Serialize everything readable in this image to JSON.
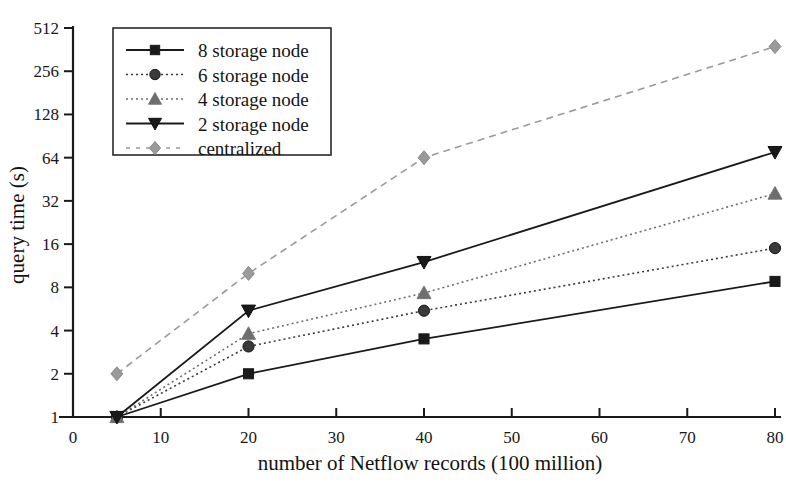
{
  "chart_data": {
    "type": "line",
    "title": "",
    "xlabel": "number of Netflow records (100 million)",
    "ylabel": "query time (s)",
    "xlim": [
      0,
      80
    ],
    "ylim": [
      1,
      512
    ],
    "yscale": "log2",
    "grid": false,
    "legend_position": "top-left",
    "xticks": [
      0,
      10,
      20,
      30,
      40,
      50,
      60,
      70,
      80
    ],
    "xtick_labels": [
      "0",
      "10",
      "20",
      "30",
      "40",
      "50",
      "60",
      "70",
      "80"
    ],
    "yticks": [
      1,
      2,
      4,
      8,
      16,
      32,
      64,
      128,
      256,
      512
    ],
    "ytick_labels": [
      "1",
      "2",
      "4",
      "8",
      "16",
      "32",
      "64",
      "128",
      "256",
      "512"
    ],
    "x": [
      5,
      20,
      40,
      80
    ],
    "series": [
      {
        "name": "8 storage node",
        "values": [
          1,
          2,
          3.5,
          8.8
        ],
        "marker": "square",
        "linestyle": "solid",
        "color": "#1a1a1a"
      },
      {
        "name": "6 storage node",
        "values": [
          1,
          3.1,
          5.5,
          15
        ],
        "marker": "circle",
        "linestyle": "dotted",
        "color": "#3a3a3a"
      },
      {
        "name": "4 storage node",
        "values": [
          1,
          3.8,
          7.3,
          36
        ],
        "marker": "triangle-up",
        "linestyle": "dotted",
        "color": "#6e6e6e"
      },
      {
        "name": "2 storage node",
        "values": [
          1,
          5.5,
          12,
          70
        ],
        "marker": "triangle-down",
        "linestyle": "solid",
        "color": "#1a1a1a"
      },
      {
        "name": "centralized",
        "values": [
          2,
          10,
          64,
          380
        ],
        "marker": "diamond",
        "linestyle": "dashed",
        "color": "#9a9a9a"
      }
    ]
  },
  "legend": {
    "items": [
      {
        "label": "8 storage node"
      },
      {
        "label": "6 storage node"
      },
      {
        "label": "4 storage node"
      },
      {
        "label": "2 storage node"
      },
      {
        "label": "centralized"
      }
    ]
  }
}
